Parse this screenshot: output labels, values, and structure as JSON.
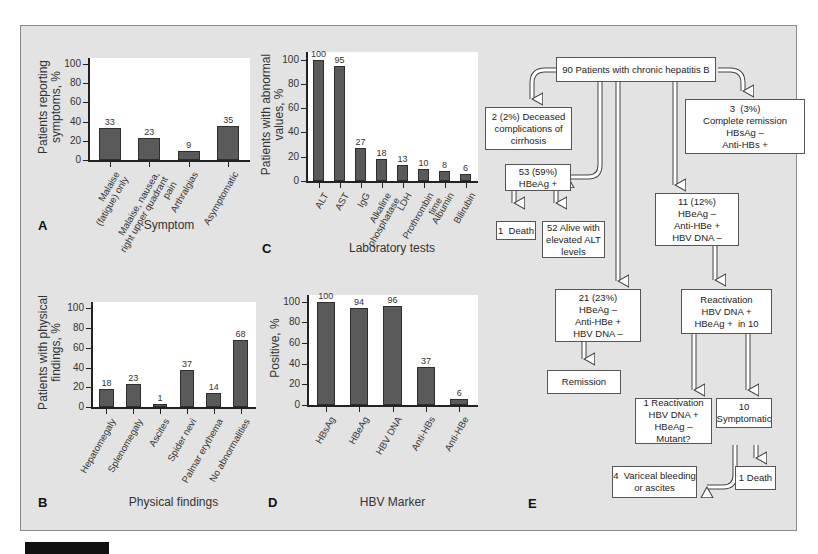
{
  "chart_data": [
    {
      "id": "A",
      "type": "bar",
      "panel_letter": "A",
      "title": "",
      "xlabel": "Symptom",
      "ylabel": "Patients reporting\nsymptoms, %",
      "ylim": [
        0,
        100
      ],
      "yticks": [
        0,
        20,
        40,
        60,
        80,
        100
      ],
      "categories": [
        "Malaise\n(fatigue) only",
        "Malaise, nausea,\nright upper quadrant\npain",
        "Arthralgias",
        "Asymptomatic"
      ],
      "values": [
        33,
        23,
        9,
        35
      ],
      "grid": false,
      "bar_color": "#5a5a5a"
    },
    {
      "id": "B",
      "type": "bar",
      "panel_letter": "B",
      "title": "",
      "xlabel": "Physical findings",
      "ylabel": "Patients with physical\nfindings, %",
      "ylim": [
        0,
        100
      ],
      "yticks": [
        0,
        20,
        40,
        60,
        80,
        100
      ],
      "categories": [
        "Hepatomegaly",
        "Splenomegaly",
        "Ascites",
        "Spider nevi",
        "Palmar erythema",
        "No abnormalities"
      ],
      "values": [
        18,
        23,
        1,
        37,
        14,
        68
      ],
      "grid": false,
      "bar_color": "#5a5a5a"
    },
    {
      "id": "C",
      "type": "bar",
      "panel_letter": "C",
      "title": "",
      "xlabel": "Laboratory tests",
      "ylabel": "Patients with abnormal\nvalues, %",
      "ylim": [
        0,
        100
      ],
      "yticks": [
        0,
        20,
        40,
        60,
        80,
        100
      ],
      "categories": [
        "ALT",
        "AST",
        "IgG",
        "Alkaline\nphosphatase",
        "LDH",
        "Prothrombin\ntime",
        "Albumin",
        "Bilirubin"
      ],
      "values": [
        100,
        95,
        27,
        18,
        13,
        10,
        8,
        6
      ],
      "grid": false,
      "bar_color": "#5a5a5a"
    },
    {
      "id": "D",
      "type": "bar",
      "panel_letter": "D",
      "title": "",
      "xlabel": "HBV Marker",
      "ylabel": "Positive, %",
      "ylim": [
        0,
        100
      ],
      "yticks": [
        0,
        20,
        40,
        60,
        80,
        100
      ],
      "categories": [
        "HBsAg",
        "HBeAg",
        "HBV DNA",
        "Anti-HBs",
        "Anti-HBe"
      ],
      "values": [
        100,
        94,
        96,
        37,
        6
      ],
      "grid": false,
      "bar_color": "#5a5a5a"
    }
  ],
  "flowchart": {
    "panel_letter": "E",
    "nodes": {
      "root": "90 Patients with chronic hepatitis B",
      "deceased": "2 (2%) Deceased\ncomplications of\ncirrhosis",
      "remission3": "3  (3%)\nComplete remission\nHBsAg –\nAnti-HBs +",
      "hbeag_pos": "53 (59%)\nHBeAg +",
      "death1": "1  Death",
      "alive52": "52 Alive with\nelevated ALT\nlevels",
      "group11": "11 (12%)\nHBeAg –\nAnti-HBe +\nHBV DNA –",
      "group21": "21 (23%)\nHBeAg –\nAnti-HBe +\nHBV DNA –",
      "remission": "Remission",
      "reactivation": "Reactivation\nHBV DNA +\nHBeAg +  in 10",
      "reactivation1": "1 Reactivation\nHBV DNA +\nHBeAg –\nMutant?",
      "symptomatic10": "10\nSymptomatic",
      "variceal": "4  Variceal bleeding\nor ascites",
      "death2": "1 Death"
    }
  }
}
